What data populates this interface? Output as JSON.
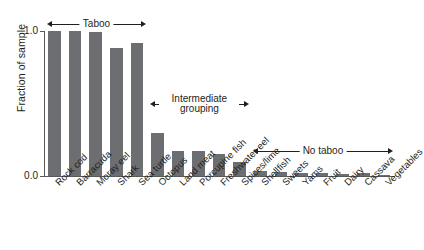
{
  "chart_data": {
    "type": "bar",
    "title": "",
    "xlabel": "",
    "ylabel": "Fraction of sample",
    "ylim": [
      0.0,
      1.0
    ],
    "ytick_labels": [
      "0.0",
      "1.0"
    ],
    "ytick_values": [
      0.0,
      1.0
    ],
    "grid": false,
    "legend": "none",
    "bar_color": "#6d6e71",
    "axis_color": "#58595b",
    "categories": [
      "Rock cod",
      "Barracuda",
      "Moray eel",
      "Shark",
      "Sea turtle",
      "Octopus",
      "Land meat",
      "Porcupine fish",
      "Freshwater eel",
      "Spices/lime",
      "Shellfish",
      "Sweets",
      "Yams",
      "Fruit",
      "Dairy",
      "Cassava",
      "Vegetables"
    ],
    "values": [
      1.0,
      1.0,
      0.99,
      0.88,
      0.92,
      0.3,
      0.17,
      0.17,
      0.15,
      0.1,
      0.035,
      0.03,
      0.02,
      0.02,
      0.015,
      0.02,
      0.005
    ],
    "annotations": [
      {
        "label": "Taboo",
        "start_category": "Rock cod",
        "end_category": "Sea turtle",
        "y": 1.05
      },
      {
        "label": "Intermediate grouping",
        "label_line1": "Intermediate",
        "label_line2": "grouping",
        "start_category": "Octopus",
        "end_category": "Spices/lime",
        "y": 0.5
      },
      {
        "label": "No taboo",
        "start_category": "Shellfish",
        "end_category": "Vegetables",
        "y": 0.175
      }
    ]
  }
}
